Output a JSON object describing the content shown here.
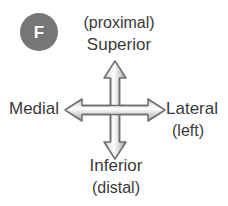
{
  "figure": {
    "panel_badge": {
      "letter": "F",
      "shape": "filled-circle",
      "fill_color": "#767676",
      "text_color": "#ffffff"
    },
    "text_color": "#3a3a3a",
    "background_color": "#ffffff",
    "arrow": {
      "name": "four-way-directional-arrow",
      "outline_color": "#6e6e6e",
      "fill_light": "#fdfdfd",
      "fill_shadow": "#b4b4b4"
    },
    "labels": {
      "superior_primary": "Superior",
      "superior_secondary": "(proximal)",
      "inferior_primary": "Inferior",
      "inferior_secondary": "(distal)",
      "medial": "Medial",
      "lateral_primary": "Lateral",
      "lateral_secondary": "(left)"
    }
  }
}
